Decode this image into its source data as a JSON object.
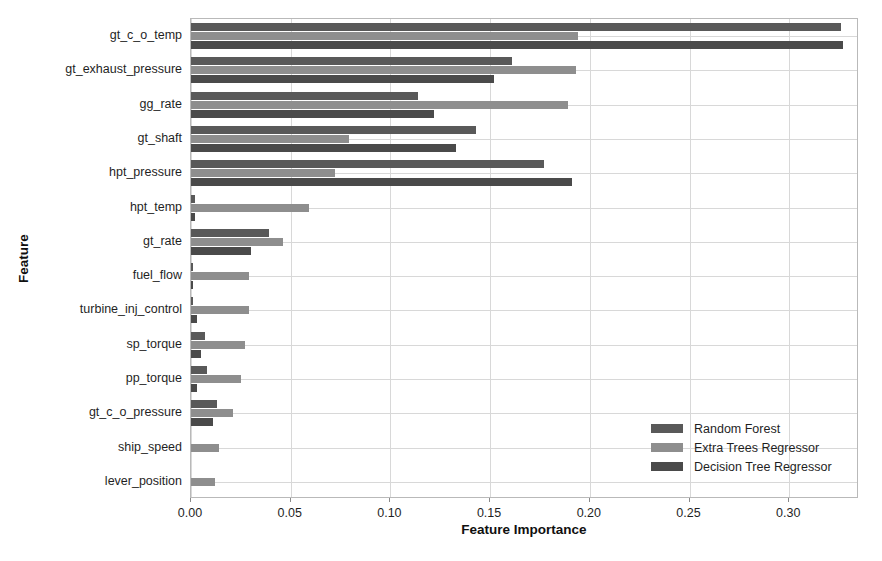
{
  "chart_data": {
    "type": "bar",
    "orientation": "horizontal",
    "title": "",
    "xlabel": "Feature Importance",
    "ylabel": "Feature",
    "xlim": [
      0.0,
      0.335
    ],
    "xticks": [
      0.0,
      0.05,
      0.1,
      0.15,
      0.2,
      0.25,
      0.3
    ],
    "xtick_labels": [
      "0.00",
      "0.05",
      "0.10",
      "0.15",
      "0.20",
      "0.25",
      "0.30"
    ],
    "grid": true,
    "legend_position": "lower right",
    "categories": [
      "gt_c_o_temp",
      "gt_exhaust_pressure",
      "gg_rate",
      "gt_shaft",
      "hpt_pressure",
      "hpt_temp",
      "gt_rate",
      "fuel_flow",
      "turbine_inj_control",
      "sp_torque",
      "pp_torque",
      "gt_c_o_pressure",
      "ship_speed",
      "lever_position"
    ],
    "series": [
      {
        "name": "Random Forest",
        "color": "#595959",
        "values": [
          0.326,
          0.161,
          0.114,
          0.143,
          0.177,
          0.002,
          0.039,
          0.001,
          0.001,
          0.007,
          0.008,
          0.013,
          0.0,
          0.0
        ]
      },
      {
        "name": "Extra Trees Regressor",
        "color": "#8e8e8e",
        "values": [
          0.194,
          0.193,
          0.189,
          0.079,
          0.072,
          0.059,
          0.046,
          0.029,
          0.029,
          0.027,
          0.025,
          0.021,
          0.014,
          0.012
        ]
      },
      {
        "name": "Decision Tree Regressor",
        "color": "#4a4a4a",
        "values": [
          0.327,
          0.152,
          0.122,
          0.133,
          0.191,
          0.002,
          0.03,
          0.001,
          0.003,
          0.005,
          0.003,
          0.011,
          0.0,
          0.0
        ]
      }
    ]
  },
  "legend": {
    "entries": [
      {
        "label": "Random Forest"
      },
      {
        "label": "Extra Trees Regressor"
      },
      {
        "label": "Decision Tree Regressor"
      }
    ]
  },
  "axes": {
    "x_title": "Feature Importance",
    "y_title": "Feature"
  }
}
